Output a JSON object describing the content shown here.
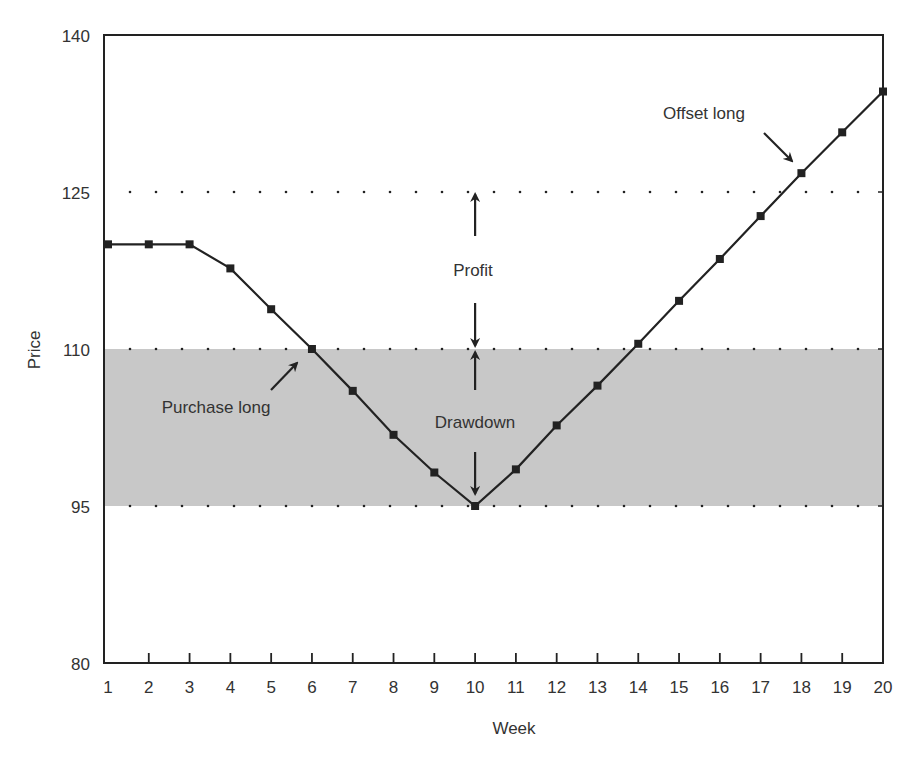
{
  "chart_data": {
    "type": "line",
    "title": "",
    "xlabel": "Week",
    "ylabel": "Price",
    "xlim": [
      1,
      20
    ],
    "ylim": [
      80,
      140
    ],
    "x": [
      1,
      2,
      3,
      4,
      5,
      6,
      7,
      8,
      9,
      10,
      11,
      12,
      13,
      14,
      15,
      16,
      17,
      18,
      19,
      20
    ],
    "x_tick_labels": [
      "1",
      "2",
      "3",
      "4",
      "5",
      "6",
      "7",
      "8",
      "9",
      "10",
      "11",
      "12",
      "13",
      "14",
      "15",
      "16",
      "17",
      "18",
      "19",
      "20"
    ],
    "y_tick_labels": [
      "140",
      "125",
      "110",
      "95",
      "80"
    ],
    "y_ticks": [
      140,
      125,
      110,
      95,
      80
    ],
    "series": [
      {
        "name": "Price",
        "marker": "square",
        "color": "#222222",
        "values": [
          120,
          120,
          120,
          117.7,
          113.8,
          110,
          106,
          101.8,
          98.2,
          95,
          98.5,
          102.7,
          106.5,
          110.5,
          114.6,
          118.6,
          122.7,
          126.8,
          130.7,
          134.6
        ]
      }
    ],
    "reference_lines": [
      {
        "y": 125,
        "style": "dotted",
        "meaning": "exit price"
      },
      {
        "y": 110,
        "style": "dotted",
        "meaning": "entry price"
      },
      {
        "y": 95,
        "style": "dotted",
        "meaning": "lowest price"
      }
    ],
    "shaded_band": {
      "y_from": 95,
      "y_to": 110,
      "color": "#c8c8c8",
      "meaning": "Drawdown"
    },
    "annotations": [
      {
        "text": "Purchase long",
        "points_to": {
          "x": 6,
          "y": 110
        }
      },
      {
        "text": "Offset long",
        "points_to": {
          "x": 18,
          "y": 126.8
        }
      },
      {
        "text": "Profit",
        "between": [
          110,
          125
        ],
        "x": 10
      },
      {
        "text": "Drawdown",
        "between": [
          95,
          110
        ],
        "x": 10
      }
    ],
    "grid": false,
    "legend": null
  },
  "labels": {
    "xlabel": "Week",
    "ylabel": "Price",
    "profit": "Profit",
    "drawdown": "Drawdown",
    "purchase_long": "Purchase long",
    "offset_long": "Offset long"
  },
  "colors": {
    "band": "#c8c8c8",
    "line": "#222222",
    "axis": "#222222"
  }
}
